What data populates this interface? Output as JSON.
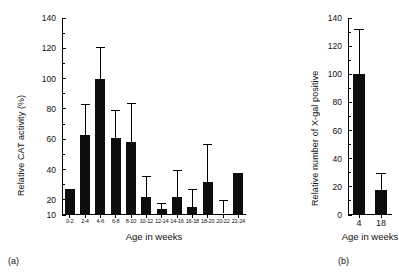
{
  "figure": {
    "background": "#ffffff",
    "bar_color": "#0d0d0d"
  },
  "panel_a": {
    "tag": "(a)",
    "ylabel": "Relative CAT activity (%)",
    "xlabel": "Age in weeks"
  },
  "panel_b": {
    "tag": "(b)",
    "ylabel": "Relative number of X-gal positive",
    "xlabel": "Age in weeks"
  },
  "chart_data": [
    {
      "type": "bar",
      "panel": "(a)",
      "title": "",
      "xlabel": "Age in weeks",
      "ylabel": "Relative CAT activity (%)",
      "ylim": [
        10,
        140
      ],
      "yticks": [
        10,
        20,
        40,
        60,
        80,
        100,
        120,
        140
      ],
      "ytick_labels": [
        "10",
        "20",
        "40",
        "60",
        "80",
        "100",
        "120",
        "140"
      ],
      "yminor_ticks": [
        30,
        50,
        70,
        90,
        110,
        130
      ],
      "grid": false,
      "legend": "none",
      "error_bars": "upper only",
      "categories": [
        "0-2",
        "2-4",
        "4-6",
        "6-8",
        "8-10",
        "10-12",
        "12-14",
        "14-16",
        "16-18",
        "18-20",
        "20-22",
        "22-24"
      ],
      "values": [
        27,
        63,
        100,
        61,
        58,
        22,
        14,
        22,
        15,
        32,
        11,
        38
      ],
      "err_upper": [
        27,
        83,
        121,
        79,
        84,
        36,
        18,
        40,
        27,
        57,
        20,
        38
      ]
    },
    {
      "type": "bar",
      "panel": "(b)",
      "title": "",
      "xlabel": "Age in weeks",
      "ylabel": "Relative number of X-gal positive",
      "ylim": [
        0,
        140
      ],
      "yticks": [
        0,
        20,
        40,
        60,
        80,
        100,
        120,
        140
      ],
      "ytick_labels": [
        "0",
        "20",
        "40",
        "60",
        "80",
        "100",
        "120",
        "140"
      ],
      "yminor_ticks": [
        10,
        30,
        50,
        70,
        90,
        110,
        130
      ],
      "grid": false,
      "legend": "none",
      "error_bars": "upper only",
      "categories": [
        "4",
        "18"
      ],
      "values": [
        100,
        18
      ],
      "err_upper": [
        132,
        30
      ]
    }
  ]
}
